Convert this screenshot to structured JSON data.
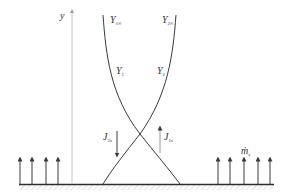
{
  "diagram": {
    "type": "boundary-layer concentration profile with surface mass transfer",
    "axis": {
      "label": "y"
    },
    "curves": [
      {
        "id": "Y1",
        "label_main": "Y",
        "label_sub": "1",
        "far_label_main": "Y",
        "far_label_sub": "1∞"
      },
      {
        "id": "Y2",
        "label_main": "Y",
        "label_sub": "2",
        "far_label_main": "Y",
        "far_label_sub": "2∞"
      }
    ],
    "fluxes": [
      {
        "id": "J2s",
        "label_main": "J",
        "label_sub": "2s",
        "direction": "down"
      },
      {
        "id": "J1s",
        "label_main": "J",
        "label_sub": "1s",
        "direction": "up"
      }
    ],
    "surface_flux": {
      "label_main": "ṁ",
      "label_sub": "s",
      "direction": "up"
    },
    "colors": {
      "line": "#3a3a3a",
      "axis": "#bdbdbd",
      "ground_hatch": "#cfcfcf",
      "background": "#ffffff"
    }
  }
}
